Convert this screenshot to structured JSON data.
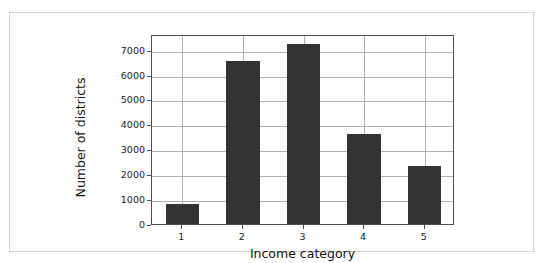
{
  "chart_data": {
    "type": "bar",
    "title": "",
    "xlabel": "Income category",
    "ylabel": "Number of districts",
    "categories": [
      "1",
      "2",
      "3",
      "4",
      "5"
    ],
    "values": [
      800,
      6560,
      7230,
      3620,
      2310
    ],
    "ytick_labels": [
      "0",
      "1000",
      "2000",
      "3000",
      "4000",
      "5000",
      "6000",
      "7000"
    ],
    "ytick_values": [
      0,
      1000,
      2000,
      3000,
      4000,
      5000,
      6000,
      7000
    ],
    "ylim": [
      0,
      7630
    ],
    "xlim": [
      0.5,
      5.5
    ],
    "grid": true,
    "legend": "none",
    "bar_color": "#333333",
    "grid_color": "#b0b0b0",
    "axis_color": "#4d4d4d",
    "frame_color": "#d2d2d2",
    "background": "#ffffff"
  }
}
